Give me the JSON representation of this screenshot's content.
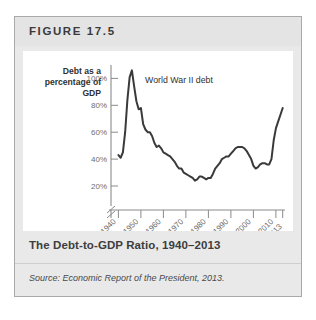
{
  "figure": {
    "label": "FIGURE 17.5",
    "caption": "The Debt-to-GDP Ratio, 1940–2013",
    "source": "Source: Economic Report of the President, 2013."
  },
  "colors": {
    "line": "#3a3a3a",
    "axis": "#8a8a8a",
    "tick_text": "#6d6d6d",
    "panel_bg": "#ffffff",
    "card_bg": "#e9e9e9",
    "card_border": "#a9a9a9",
    "header_bg": "#e4e4e4"
  },
  "chart_data": {
    "type": "line",
    "title": "The Debt-to-GDP Ratio, 1940–2013",
    "xlabel": "Year",
    "ylabel": "Debt as a percentage of GDP",
    "ylabel_lines": [
      "Debt as a",
      "percentage of",
      "GDP"
    ],
    "xlim": [
      1938,
      2014
    ],
    "ylim": [
      16,
      112
    ],
    "axis_break": true,
    "grid": false,
    "legend": false,
    "yticks": [
      20,
      40,
      60,
      80,
      100
    ],
    "ytick_labels": [
      "20%",
      "40%",
      "60%",
      "80%",
      "100%"
    ],
    "xticks": [
      1940,
      1950,
      1960,
      1970,
      1980,
      1990,
      2000,
      2010,
      2013
    ],
    "xtick_labels": [
      "1940",
      "1950",
      "1960",
      "1970",
      "1980",
      "1990",
      "2000",
      "2010",
      "2013"
    ],
    "annotations": [
      {
        "text": "World War II debt",
        "x": 1947,
        "y": 103
      }
    ],
    "series": [
      {
        "name": "Debt as a percentage of GDP",
        "x": [
          1940,
          1941,
          1942,
          1943,
          1944,
          1945,
          1946,
          1947,
          1948,
          1949,
          1950,
          1951,
          1952,
          1953,
          1954,
          1955,
          1956,
          1957,
          1958,
          1959,
          1960,
          1961,
          1962,
          1963,
          1964,
          1965,
          1966,
          1967,
          1968,
          1969,
          1970,
          1971,
          1972,
          1973,
          1974,
          1975,
          1976,
          1977,
          1978,
          1979,
          1980,
          1981,
          1982,
          1983,
          1984,
          1985,
          1986,
          1987,
          1988,
          1989,
          1990,
          1991,
          1992,
          1993,
          1994,
          1995,
          1996,
          1997,
          1998,
          1999,
          2000,
          2001,
          2002,
          2003,
          2004,
          2005,
          2006,
          2007,
          2008,
          2009,
          2010,
          2011,
          2012,
          2013
        ],
        "y": [
          43,
          41,
          45,
          60,
          84,
          101,
          106,
          94,
          83,
          77,
          78,
          66,
          62,
          60,
          60,
          57,
          52,
          49,
          50,
          48,
          45,
          44,
          43,
          42,
          40,
          38,
          35,
          33,
          33,
          30,
          29,
          28,
          27,
          26,
          24,
          25,
          27,
          27,
          26,
          25,
          26,
          26,
          29,
          33,
          35,
          37,
          40,
          41,
          42,
          42,
          44,
          46,
          48,
          49,
          49,
          49,
          48,
          46,
          43,
          40,
          35,
          33,
          34,
          36,
          37,
          37,
          36,
          36,
          40,
          54,
          63,
          68,
          73,
          78
        ]
      }
    ]
  }
}
